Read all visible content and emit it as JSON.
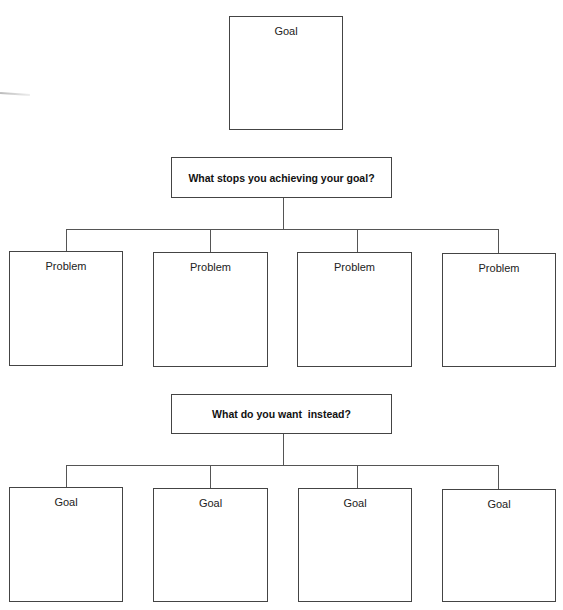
{
  "root": {
    "label": "Goal"
  },
  "question1": {
    "label": "What stops you achieving your goal?"
  },
  "problems": [
    {
      "label": "Problem"
    },
    {
      "label": "Problem"
    },
    {
      "label": "Problem"
    },
    {
      "label": "Problem"
    }
  ],
  "question2": {
    "label": "What do you want  instead?"
  },
  "goals": [
    {
      "label": "Goal"
    },
    {
      "label": "Goal"
    },
    {
      "label": "Goal"
    },
    {
      "label": "Goal"
    }
  ],
  "colors": {
    "line": "#555555",
    "border": "#444444",
    "background": "#ffffff"
  }
}
